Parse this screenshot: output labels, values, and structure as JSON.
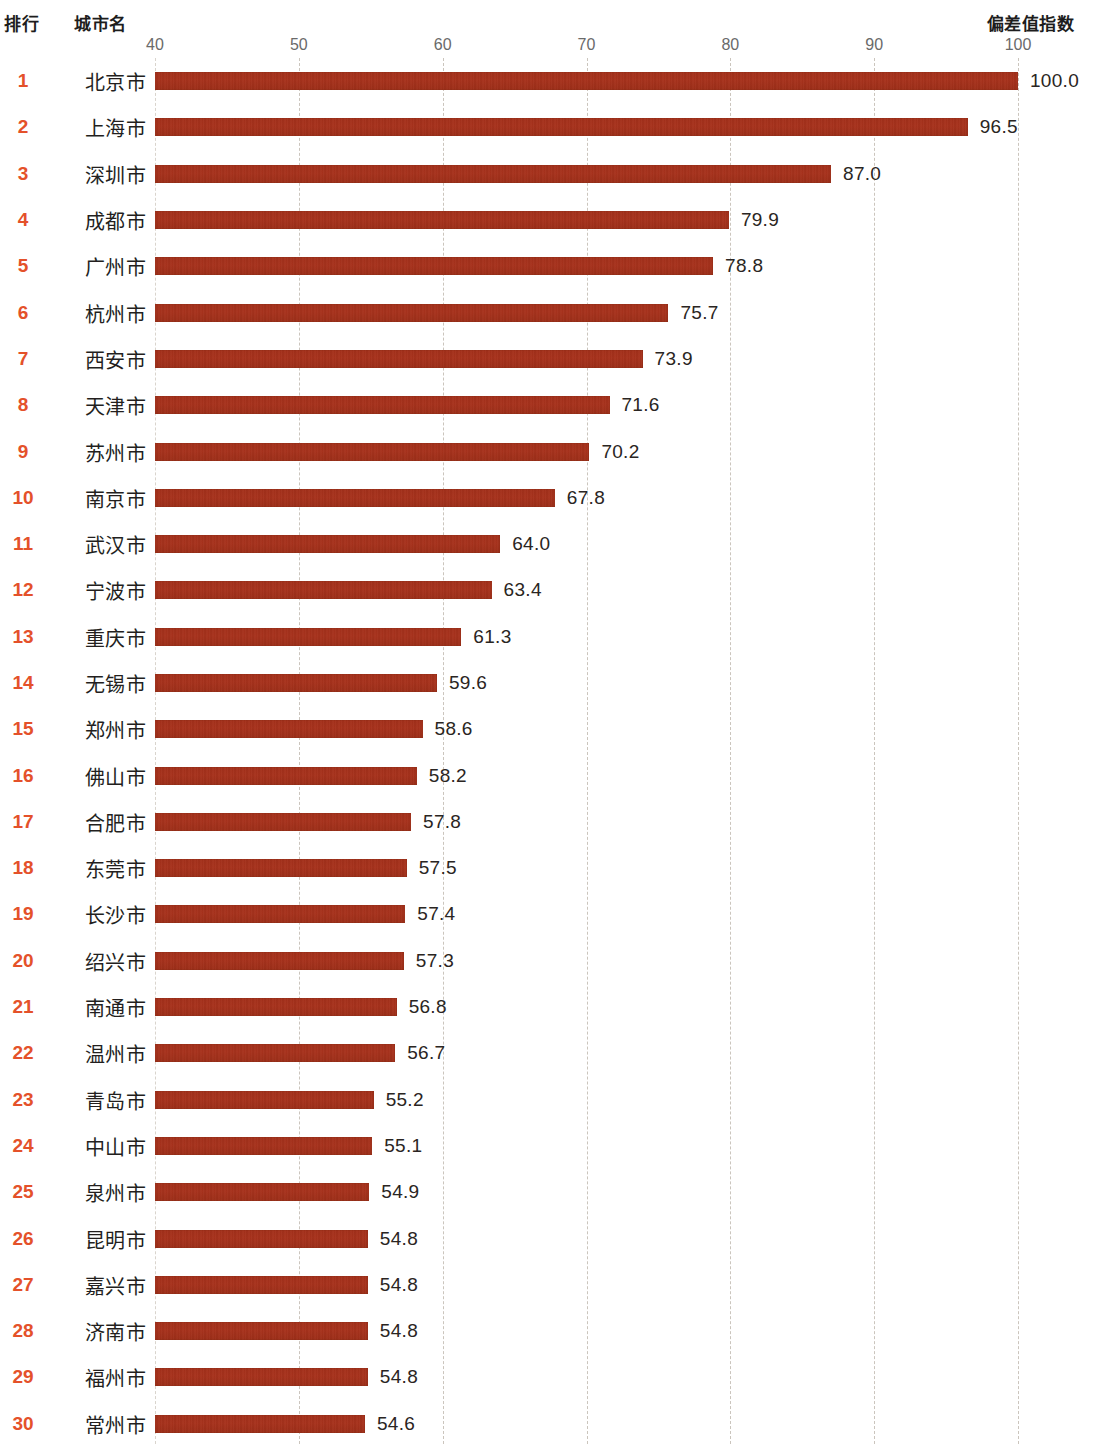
{
  "headers": {
    "rank": "排行",
    "city": "城市名",
    "value": "偏差值指数"
  },
  "colors": {
    "bar": "#a8311b",
    "rank_text": "#e4512a",
    "gridline": "#c9c2ba",
    "axis_text": "#6a6a6a",
    "label_text": "#231f1e",
    "background": "#ffffff"
  },
  "chart_data": {
    "type": "bar",
    "orientation": "horizontal",
    "title": "",
    "xlabel": "偏差值指数",
    "ylabel": "城市名",
    "xlim": [
      40,
      100
    ],
    "xticks": [
      40,
      50,
      60,
      70,
      80,
      90,
      100
    ],
    "xtick_labels": [
      "40",
      "50",
      "60",
      "70",
      "80",
      "90",
      "100"
    ],
    "grid": true,
    "legend": "none",
    "categories": [
      "北京市",
      "上海市",
      "深圳市",
      "成都市",
      "广州市",
      "杭州市",
      "西安市",
      "天津市",
      "苏州市",
      "南京市",
      "武汉市",
      "宁波市",
      "重庆市",
      "无锡市",
      "郑州市",
      "佛山市",
      "合肥市",
      "东莞市",
      "长沙市",
      "绍兴市",
      "南通市",
      "温州市",
      "青岛市",
      "中山市",
      "泉州市",
      "昆明市",
      "嘉兴市",
      "济南市",
      "福州市",
      "常州市"
    ],
    "values": [
      100.0,
      96.5,
      87.0,
      79.9,
      78.8,
      75.7,
      73.9,
      71.6,
      70.2,
      67.8,
      64.0,
      63.4,
      61.3,
      59.6,
      58.6,
      58.2,
      57.8,
      57.5,
      57.4,
      57.3,
      56.8,
      56.7,
      55.2,
      55.1,
      54.9,
      54.8,
      54.8,
      54.8,
      54.8,
      54.6
    ],
    "value_labels": [
      "100.0",
      "96.5",
      "87.0",
      "79.9",
      "78.8",
      "75.7",
      "73.9",
      "71.6",
      "70.2",
      "67.8",
      "64.0",
      "63.4",
      "61.3",
      "59.6",
      "58.6",
      "58.2",
      "57.8",
      "57.5",
      "57.4",
      "57.3",
      "56.8",
      "56.7",
      "55.2",
      "55.1",
      "54.9",
      "54.8",
      "54.8",
      "54.8",
      "54.8",
      "54.6"
    ],
    "ranks": [
      "1",
      "2",
      "3",
      "4",
      "5",
      "6",
      "7",
      "8",
      "9",
      "10",
      "11",
      "12",
      "13",
      "14",
      "15",
      "16",
      "17",
      "18",
      "19",
      "20",
      "21",
      "22",
      "23",
      "24",
      "25",
      "26",
      "27",
      "28",
      "29",
      "30"
    ]
  }
}
